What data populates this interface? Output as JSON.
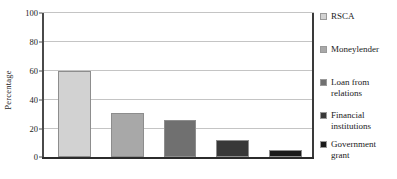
{
  "chart_data": {
    "type": "bar",
    "title": "",
    "xlabel": "",
    "ylabel": "Percentage",
    "ylim": [
      0,
      100
    ],
    "yticks": [
      0,
      20,
      40,
      60,
      80,
      100
    ],
    "ytick_labels": [
      "0",
      "20",
      "40",
      "60",
      "80",
      "100"
    ],
    "grid": true,
    "legend_position": "right",
    "categories": [
      "RSCA",
      "Moneylender",
      "Loan from relations",
      "Financial institutions",
      "Government grant"
    ],
    "values": [
      60,
      31,
      26,
      12,
      5
    ],
    "colors": [
      "#d2d2d2",
      "#a8a8a8",
      "#707070",
      "#383838",
      "#1a1a1a"
    ]
  },
  "legend": {
    "entries": [
      {
        "label": "RSCA",
        "color": "#d2d2d2"
      },
      {
        "label": "Moneylender",
        "color": "#a8a8a8"
      },
      {
        "label": "Loan from\nrelations",
        "color": "#707070"
      },
      {
        "label": "Financial\ninstitutions",
        "color": "#383838"
      },
      {
        "label": "Government\ngrant",
        "color": "#1a1a1a"
      }
    ]
  }
}
